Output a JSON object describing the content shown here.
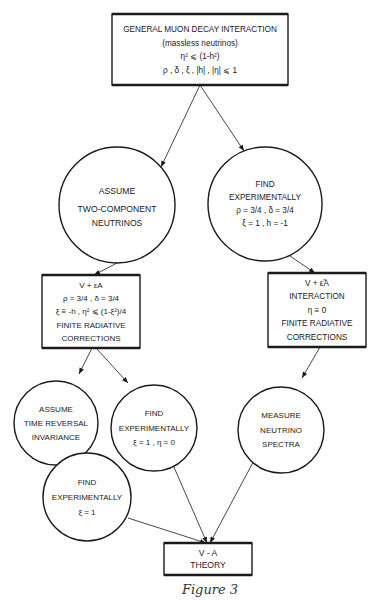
{
  "figure": {
    "caption": "Figure 3",
    "nodes": [
      {
        "id": "general",
        "shape": "box",
        "lines": [
          "GENERAL MUON DECAY INTERACTION",
          "(massless neutrinos)",
          "η² ⩽ (1-h²)",
          "ρ , δ , ξ , |h| , |η| ⩽ 1"
        ]
      },
      {
        "id": "assume-two-component",
        "shape": "circle",
        "lines": [
          "ASSUME",
          "TWO-COMPONENT",
          "NEUTRINOS"
        ]
      },
      {
        "id": "find-exp-1",
        "shape": "circle",
        "lines": [
          "FIND",
          "EXPERIMENTALLY",
          "ρ = 3/4 , δ = 3/4",
          "ξ = 1 , h = -1"
        ]
      },
      {
        "id": "v-plus-eps-a",
        "shape": "box",
        "lines": [
          "V + εA",
          "ρ = 3/4 , δ = 3/4",
          "ξ ≡ -h , η² ⩽ (1-ξ²)/4",
          "FINITE RADIATIVE",
          "CORRECTIONS"
        ]
      },
      {
        "id": "v-plus-eps-tilde-a",
        "shape": "box",
        "lines": [
          "V + ε̃A",
          "INTERACTION",
          "η ≡ 0",
          "FINITE RADIATIVE",
          "CORRECTIONS"
        ]
      },
      {
        "id": "assume-time-reversal",
        "shape": "circle",
        "lines": [
          "ASSUME",
          "TIME REVERSAL",
          "INVARIANCE"
        ]
      },
      {
        "id": "find-exp-2",
        "shape": "circle",
        "lines": [
          "FIND",
          "EXPERIMENTALLY",
          "ξ = 1 , η = 0"
        ]
      },
      {
        "id": "measure-spectra",
        "shape": "circle",
        "lines": [
          "MEASURE",
          "NEUTRINO",
          "SPECTRA"
        ]
      },
      {
        "id": "find-exp-3",
        "shape": "circle",
        "lines": [
          "FIND",
          "EXPERIMENTALLY",
          "ξ = 1"
        ]
      },
      {
        "id": "v-minus-a",
        "shape": "box",
        "lines": [
          "V - A",
          "THEORY"
        ]
      }
    ],
    "edges": [
      {
        "from": "general",
        "to": "assume-two-component"
      },
      {
        "from": "general",
        "to": "find-exp-1"
      },
      {
        "from": "assume-two-component",
        "to": "v-plus-eps-a"
      },
      {
        "from": "find-exp-1",
        "to": "v-plus-eps-tilde-a"
      },
      {
        "from": "v-plus-eps-a",
        "to": "assume-time-reversal"
      },
      {
        "from": "v-plus-eps-a",
        "to": "find-exp-2"
      },
      {
        "from": "v-plus-eps-tilde-a",
        "to": "measure-spectra"
      },
      {
        "from": "assume-time-reversal",
        "to": "find-exp-3"
      },
      {
        "from": "find-exp-3",
        "to": "v-minus-a"
      },
      {
        "from": "find-exp-2",
        "to": "v-minus-a"
      },
      {
        "from": "measure-spectra",
        "to": "v-minus-a"
      }
    ]
  }
}
